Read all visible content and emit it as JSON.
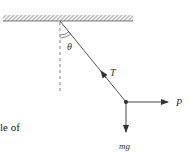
{
  "diagram": {
    "type": "pendulum-free-body-diagram",
    "ceiling": {
      "hatched": true,
      "x1": 3,
      "x2": 133,
      "y": 21
    },
    "pivot": {
      "x": 60,
      "y": 21
    },
    "mass": {
      "x": 126,
      "y": 102
    },
    "vertical_reference": {
      "style": "dashed",
      "y_end": 92
    },
    "labels": {
      "angle": "θ",
      "tension": "T",
      "force_p": "P",
      "weight": "mg"
    },
    "forces": [
      {
        "name": "T",
        "direction": "along string toward pivot"
      },
      {
        "name": "P",
        "direction": "horizontal right"
      },
      {
        "name": "mg",
        "direction": "vertical down"
      }
    ]
  },
  "text_fragment": "le of",
  "colors": {
    "line": "#444444",
    "hatch": "#666666",
    "text": "#333333"
  }
}
